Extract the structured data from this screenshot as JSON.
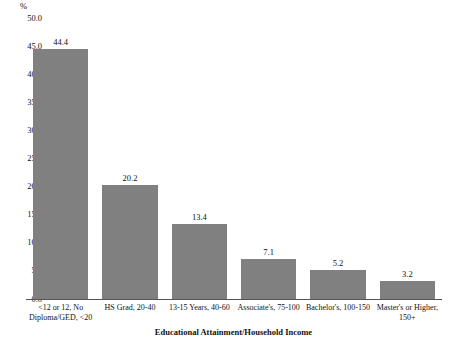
{
  "chart_data": {
    "type": "bar",
    "title": "",
    "subtitle": "",
    "xlabel": "Educational Attainment/Household Income",
    "ylabel": "%",
    "categories": [
      "<12 or 12, No Diploma/GED, <20",
      "HS Grad, 20-40",
      "13-15 Years, 40-60",
      "Associate's, 75-100",
      "Bachelor's, 100-150",
      "Master's or Higher, 150+"
    ],
    "values": [
      44.4,
      20.2,
      13.4,
      7.1,
      5.2,
      3.2
    ],
    "value_labels": [
      "44.4",
      "20.2",
      "13.4",
      "7.1",
      "5.2",
      "3.2"
    ],
    "ylim": [
      0.0,
      50.0
    ],
    "ytick_step": 5.0,
    "ytick_labels": [
      "50.0",
      "45.0",
      "40.0",
      "35.0",
      "30.0",
      "25.0",
      "20.0",
      "15.0",
      "10.0",
      "5.0",
      "0.0"
    ],
    "ytick_values": [
      50.0,
      45.0,
      40.0,
      35.0,
      30.0,
      25.0,
      20.0,
      15.0,
      10.0,
      5.0,
      0.0
    ],
    "grid": false,
    "legend": false,
    "legend_position": "none",
    "bar_color": "#808080",
    "axis_color": "#555555",
    "text_color": "#111111",
    "background_color": "#ffffff"
  }
}
